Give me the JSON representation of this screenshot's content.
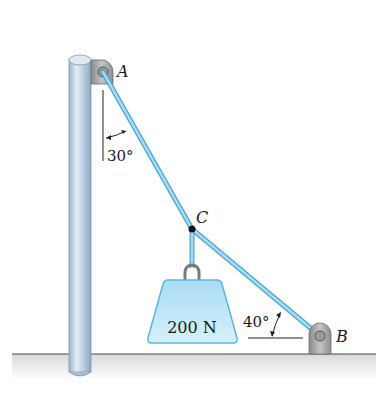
{
  "diagram": {
    "type": "statics-free-body-setup",
    "points": {
      "A": {
        "label": "A",
        "x": 103,
        "y": 72
      },
      "B": {
        "label": "B",
        "x": 320,
        "y": 336
      },
      "C": {
        "label": "C",
        "x": 192,
        "y": 229
      }
    },
    "cables": [
      {
        "from": "A",
        "to": "C"
      },
      {
        "from": "C",
        "to": "B"
      },
      {
        "from": "C",
        "to": "weight"
      }
    ],
    "weight": {
      "label": "200 N"
    },
    "angles": {
      "at_A": {
        "label": "30°",
        "reference": "vertical"
      },
      "at_B": {
        "label": "40°",
        "reference": "horizontal"
      }
    },
    "colors": {
      "cable": "#8fd0ee",
      "cable_edge": "#4aa6d2",
      "pole": "#b9cfe2",
      "pole_shade": "#8faac4",
      "weight_fill": "#bfe6f6",
      "weight_edge": "#5bb6df",
      "bracket": "#a8a8a8",
      "ground": "#e6e6e6",
      "ink": "#1a1a1a"
    }
  }
}
